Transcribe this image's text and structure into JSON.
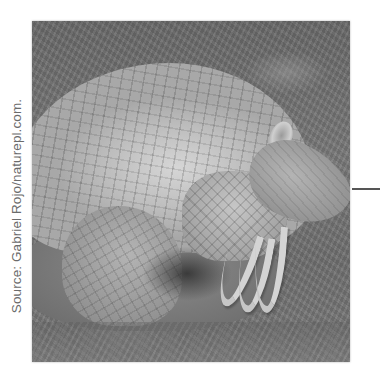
{
  "figure": {
    "photo_subject": "giant armadillo",
    "photo_alt": "Black-and-white photo of a giant armadillo curled on grassy dirt ground, showing its banded shell, long foreclaws, and elongated head",
    "credit": "Source: Gabriel Rojo/naturepl.com.",
    "pointer_line_color": "#555555",
    "credit_color": "#6b6b6b"
  }
}
